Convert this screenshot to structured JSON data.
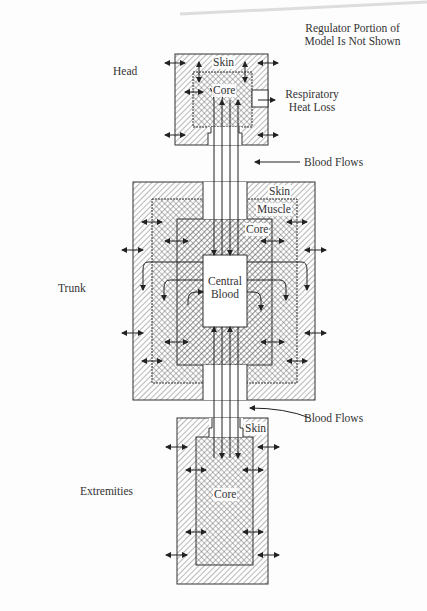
{
  "figure": {
    "note_line1": "Regulator Portion of",
    "note_line2": "Model Is Not Shown",
    "segments": {
      "head": {
        "label": "Head",
        "skin": "Skin",
        "core": "Core"
      },
      "trunk": {
        "label": "Trunk",
        "skin": "Skin",
        "muscle": "Muscle",
        "core": "Core",
        "central_line1": "Central",
        "central_line2": "Blood"
      },
      "extremities": {
        "label": "Extremities",
        "skin": "Skin",
        "core": "Core"
      }
    },
    "annotations": {
      "respiratory_line1": "Respiratory",
      "respiratory_line2": "Heat Loss",
      "blood_flows_upper": "Blood Flows",
      "blood_flows_lower": "Blood Flows"
    },
    "colors": {
      "line": "#333333",
      "hatch": "#555555",
      "paper": "#fdfdfd"
    }
  }
}
